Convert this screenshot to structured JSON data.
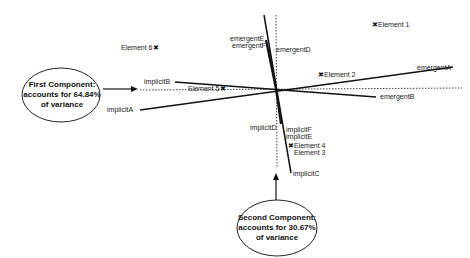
{
  "diagram": {
    "type": "biplot",
    "components": {
      "first": {
        "line1": "First Component:",
        "line2": "accounts for 64.84%",
        "line3": "of variance",
        "variance_pct": 64.84
      },
      "second": {
        "line1": "Second Component:",
        "line2": "accounts for 30.67%",
        "line3": "of variance",
        "variance_pct": 30.67
      }
    },
    "constructs": {
      "emergentA": "emergentA",
      "emergentB": "emergentB",
      "emergentD": "emergentD",
      "emergentE": "emergentE",
      "emergentF": "emergentF",
      "implicitA": "implicitA",
      "implicitB": "implicitB",
      "implicitC": "implicitC",
      "implicitD": "implicitD",
      "implicitE": "implicitE",
      "implicitF": "implicitF"
    },
    "elements": {
      "e1": "Element 1",
      "e2": "Element 2",
      "e3": "Element 3",
      "e4": "Element 4",
      "e5": "Element 5",
      "e6": "Element 6"
    },
    "marker": "✖",
    "colors": {
      "line": "#111111",
      "dotted": "#444444",
      "background": "#ffffff"
    }
  }
}
